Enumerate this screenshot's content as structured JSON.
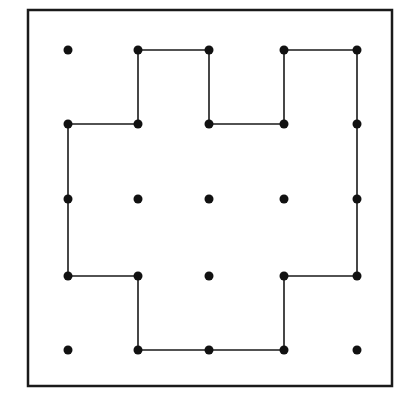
{
  "diagram": {
    "title": "",
    "frame": {
      "x": 28,
      "y": 10,
      "width": 364,
      "height": 376,
      "stroke": "#1a1a1a",
      "stroke_width": 2.5
    },
    "grid": {
      "columns": [
        68,
        138,
        209,
        284,
        357
      ],
      "rows": [
        50,
        124,
        199,
        276,
        350
      ]
    },
    "dot_color": "#111111",
    "dot_radius": 4.5,
    "line_color": "#1a1a1a",
    "line_width": 1.6,
    "dots": [
      {
        "col": 0,
        "row": 0
      },
      {
        "col": 1,
        "row": 0
      },
      {
        "col": 2,
        "row": 0
      },
      {
        "col": 3,
        "row": 0
      },
      {
        "col": 4,
        "row": 0
      },
      {
        "col": 0,
        "row": 1
      },
      {
        "col": 1,
        "row": 1
      },
      {
        "col": 2,
        "row": 1
      },
      {
        "col": 3,
        "row": 1
      },
      {
        "col": 4,
        "row": 1
      },
      {
        "col": 0,
        "row": 2
      },
      {
        "col": 1,
        "row": 2
      },
      {
        "col": 2,
        "row": 2
      },
      {
        "col": 3,
        "row": 2
      },
      {
        "col": 4,
        "row": 2
      },
      {
        "col": 0,
        "row": 3
      },
      {
        "col": 1,
        "row": 3
      },
      {
        "col": 2,
        "row": 3
      },
      {
        "col": 3,
        "row": 3
      },
      {
        "col": 4,
        "row": 3
      },
      {
        "col": 0,
        "row": 4
      },
      {
        "col": 1,
        "row": 4
      },
      {
        "col": 2,
        "row": 4
      },
      {
        "col": 3,
        "row": 4
      },
      {
        "col": 4,
        "row": 4
      }
    ],
    "path": [
      {
        "col": 1,
        "row": 0
      },
      {
        "col": 2,
        "row": 0
      },
      {
        "col": 2,
        "row": 1
      },
      {
        "col": 3,
        "row": 1
      },
      {
        "col": 3,
        "row": 0
      },
      {
        "col": 4,
        "row": 0
      },
      {
        "col": 4,
        "row": 1
      },
      {
        "col": 4,
        "row": 2
      },
      {
        "col": 4,
        "row": 3
      },
      {
        "col": 3,
        "row": 3
      },
      {
        "col": 3,
        "row": 4
      },
      {
        "col": 2,
        "row": 4
      },
      {
        "col": 1,
        "row": 4
      },
      {
        "col": 1,
        "row": 3
      },
      {
        "col": 0,
        "row": 3
      },
      {
        "col": 0,
        "row": 2
      },
      {
        "col": 0,
        "row": 1
      },
      {
        "col": 1,
        "row": 1
      }
    ]
  }
}
